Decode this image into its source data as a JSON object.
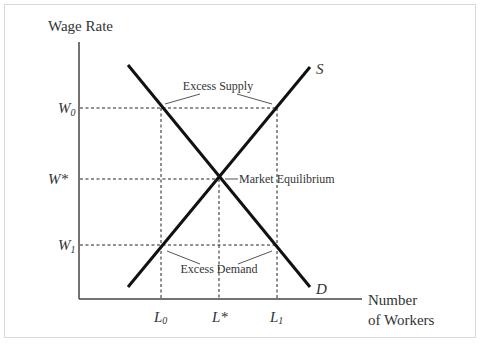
{
  "diagram": {
    "type": "supply-demand",
    "y_axis_label": "Wage Rate",
    "x_axis_label_line1": "Number",
    "x_axis_label_line2": "of Workers",
    "y_ticks": {
      "w0": {
        "base": "W",
        "sub": "0"
      },
      "wstar": {
        "base": "W",
        "sup": "*"
      },
      "w1": {
        "base": "W",
        "sub": "1"
      }
    },
    "x_ticks": {
      "l0": {
        "base": "L",
        "sub": "0"
      },
      "lstar": {
        "base": "L",
        "sup": "*"
      },
      "l1": {
        "base": "L",
        "sub": "1"
      }
    },
    "curves": {
      "supply_label": "S",
      "demand_label": "D"
    },
    "annotations": {
      "excess_supply": "Excess Supply",
      "excess_demand": "Excess Demand",
      "equilibrium": "Market Equilibrium"
    },
    "colors": {
      "curve": "#111111",
      "axis": "#444444",
      "dashed": "#222222",
      "text": "#333333",
      "frame": "#d9d9d9"
    }
  }
}
